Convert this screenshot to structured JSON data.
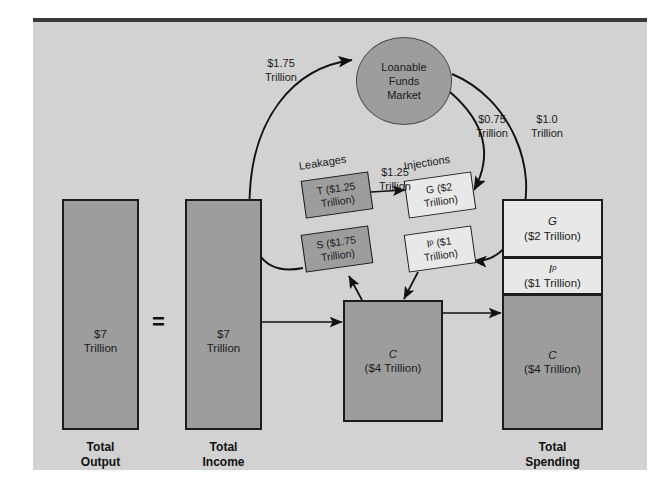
{
  "diagram": {
    "colors": {
      "background": "#d2d2d2",
      "gray_fill": "#9d9d9d",
      "light_fill": "#e8e8e8",
      "stroke": "#1c1c1c",
      "frame_top": "#3a3a3a"
    },
    "loanable_funds": {
      "line1": "Loanable",
      "line2": "Funds",
      "line3": "Market"
    },
    "bars": {
      "total_output": {
        "value_line1": "$7",
        "value_line2": "Trillion",
        "caption_line1": "Total",
        "caption_line2": "Output"
      },
      "total_income": {
        "value_line1": "$7",
        "value_line2": "Trillion",
        "caption_line1": "Total",
        "caption_line2": "Income"
      },
      "consumption_center": {
        "symbol": "C",
        "value": "($4 Trillion)"
      },
      "total_spending": {
        "caption_line1": "Total",
        "caption_line2": "Spending",
        "segments": [
          {
            "symbol": "G",
            "value": "($2 Trillion)"
          },
          {
            "symbol": "Iᵖ",
            "value": "($1 Trillion)"
          },
          {
            "symbol": "C",
            "value": "($4 Trillion)"
          }
        ]
      }
    },
    "equals_sign": "=",
    "groups": {
      "leakages_header": "Leakages",
      "injections_header": "Injections"
    },
    "leakage_boxes": [
      {
        "symbol": "T",
        "line1": "T ($1.25",
        "line2": "Trillion)"
      },
      {
        "symbol": "S",
        "line1": "S ($1.75",
        "line2": "Trillion)"
      }
    ],
    "injection_boxes": [
      {
        "symbol": "G",
        "line1": "G ($2",
        "line2": "Trillion)"
      },
      {
        "symbol": "Ip",
        "line1": "Iᵖ ($1",
        "line2": "Trillion)"
      }
    ],
    "flow_labels": {
      "savings_to_lfm": {
        "line1": "$1.75",
        "line2": "Trillion"
      },
      "taxes_to_gov": {
        "line1": "$1.25",
        "line2": "Trillion"
      },
      "lfm_to_gov": {
        "line1": "$0.75",
        "line2": "Trillion"
      },
      "lfm_to_invest": {
        "line1": "$1.0",
        "line2": "Trillion"
      }
    }
  }
}
